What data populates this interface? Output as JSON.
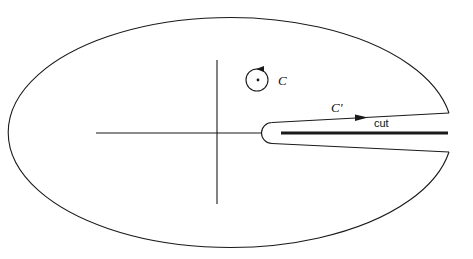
{
  "diagram": {
    "type": "contour-integration",
    "labels": {
      "contour_c": "C",
      "contour_c_prime": "C'",
      "cut": "cut"
    },
    "colors": {
      "stroke": "#1a1a1a",
      "background": "#ffffff"
    },
    "elements": [
      {
        "name": "outer-contour",
        "kind": "large ellipse open at right around cut"
      },
      {
        "name": "real-axis",
        "kind": "horizontal axis"
      },
      {
        "name": "imaginary-axis",
        "kind": "vertical axis"
      },
      {
        "name": "contour-c",
        "kind": "small circle around pole with arrow"
      },
      {
        "name": "keyhole-contour",
        "kind": "keyhole around branch cut with arrow"
      },
      {
        "name": "branch-cut",
        "kind": "thick line along positive real axis"
      }
    ]
  }
}
